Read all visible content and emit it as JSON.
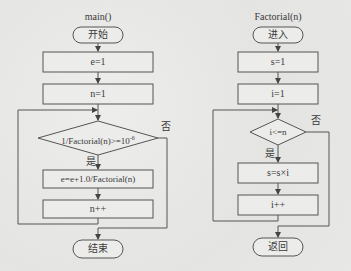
{
  "main_flowchart": {
    "title": "main()",
    "start": "开始",
    "steps": [
      "e=1",
      "n=1"
    ],
    "condition": {
      "text": "1/Factorial(n)>=10",
      "exponent": "-6"
    },
    "yes_label": "是",
    "no_label": "否",
    "loop_body": [
      "e=e+1.0/Factorial(n)",
      "n++"
    ],
    "end": "结束"
  },
  "factorial_flowchart": {
    "title": "Factorial(n)",
    "start": "进入",
    "steps": [
      "s=1",
      "i=1"
    ],
    "condition": "i<=n",
    "yes_label": "是",
    "no_label": "否",
    "loop_body": [
      "s=s×i",
      "i++"
    ],
    "end": "返回"
  },
  "colors": {
    "line": "#555555",
    "box_fill": "#eaeaea",
    "background": "#e9e9e7"
  }
}
